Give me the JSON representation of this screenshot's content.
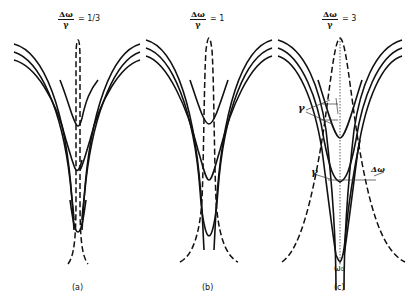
{
  "figure": {
    "panels": [
      {
        "id": "a",
        "label": "(a)",
        "ratio_num": "Δω",
        "ratio_den": "γ",
        "ratio_value": "= 1/3",
        "value_num": "1",
        "value_den": "3"
      },
      {
        "id": "b",
        "label": "(b)",
        "ratio_num": "Δω",
        "ratio_den": "γ",
        "ratio_value": "= 1"
      },
      {
        "id": "c",
        "label": "(c)",
        "ratio_num": "Δω",
        "ratio_den": "γ",
        "ratio_value": "= 3"
      }
    ],
    "annotations": {
      "gamma_upper": "γ",
      "gamma_lower": "γ",
      "delta_omega": "Δω",
      "omega_0": "ω₀"
    }
  }
}
